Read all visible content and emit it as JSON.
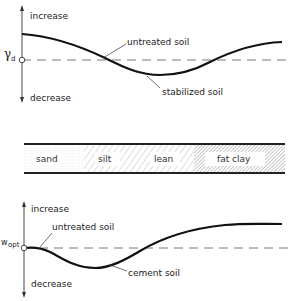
{
  "top_chart": {
    "y_symbol": "γ",
    "y_subscript": "d",
    "increase_label": "increase",
    "decrease_label": "decrease",
    "untreated_label": "untreated soil",
    "treated_label": "stabilized soil"
  },
  "soil_strip": {
    "segments": [
      {
        "label": "sand"
      },
      {
        "label": "silt"
      },
      {
        "label": "lean"
      },
      {
        "label": "fat clay"
      }
    ]
  },
  "bottom_chart": {
    "y_symbol": "w",
    "y_subscript": "opt",
    "increase_label": "increase",
    "decrease_label": "decrease",
    "untreated_label": "untreated soil",
    "treated_label": "cement soil"
  }
}
